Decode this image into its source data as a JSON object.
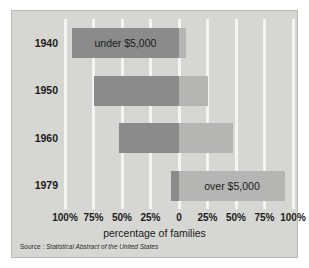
{
  "chart_data": {
    "type": "bar",
    "orientation": "horizontal",
    "subtype": "diverging-bidirectional",
    "title": "",
    "xlabel": "percentage of families",
    "ylabel": "",
    "categories": [
      "1940",
      "1950",
      "1960",
      "1979"
    ],
    "xlim": [
      -100,
      100
    ],
    "axis_unit": "%",
    "grid": true,
    "legend_position": "in-bars",
    "series": [
      {
        "name": "under $5,000",
        "direction": "left",
        "color": "#8b8b8b",
        "values": [
          94,
          75,
          53,
          7
        ]
      },
      {
        "name": "over $5,000",
        "direction": "right",
        "color": "#b5b5b3",
        "values": [
          6,
          25,
          47,
          93
        ]
      }
    ],
    "xticks": [
      {
        "value": -100,
        "label": "100%"
      },
      {
        "value": -75,
        "label": "75%"
      },
      {
        "value": -50,
        "label": "50%"
      },
      {
        "value": -25,
        "label": "25%"
      },
      {
        "value": 0,
        "label": "0"
      },
      {
        "value": 25,
        "label": "25%"
      },
      {
        "value": 50,
        "label": "50%"
      },
      {
        "value": 75,
        "label": "75%"
      },
      {
        "value": 100,
        "label": "100%"
      }
    ],
    "annotations": [
      {
        "row": "1940",
        "text": "under $5,000",
        "side": "left"
      },
      {
        "row": "1979",
        "text": "over $5,000",
        "side": "right"
      }
    ],
    "source_label": "Source :",
    "source_title": "Statistical Abstract of the United States"
  },
  "colors": {
    "page_background": "#ffffff",
    "panel_background": "#d6d6d3",
    "gridline": "#f4f4f2",
    "bar_under": "#8b8b8b",
    "bar_over": "#b5b5b3",
    "text": "#1b1b1b"
  },
  "rows": [
    {
      "year": "1940",
      "under": 94,
      "over": 6,
      "label": "under $5,000",
      "label_side": "left"
    },
    {
      "year": "1950",
      "under": 75,
      "over": 25,
      "label": "",
      "label_side": ""
    },
    {
      "year": "1960",
      "under": 53,
      "over": 47,
      "label": "",
      "label_side": ""
    },
    {
      "year": "1979",
      "under": 7,
      "over": 93,
      "label": "over $5,000",
      "label_side": "right"
    }
  ],
  "axis": {
    "title": "percentage of families"
  },
  "source": {
    "label": "Source :",
    "title": "Statistical Abstract of the United States"
  }
}
